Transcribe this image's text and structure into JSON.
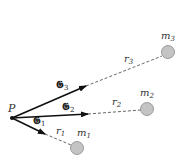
{
  "diagram": {
    "point_label": "P",
    "vectors": [
      {
        "label": "𝕲",
        "subscript": "1"
      },
      {
        "label": "𝕲",
        "subscript": "2"
      },
      {
        "label": "𝕲",
        "subscript": "3"
      }
    ],
    "distances": [
      {
        "label": "r",
        "subscript": "1"
      },
      {
        "label": "r",
        "subscript": "2"
      },
      {
        "label": "r",
        "subscript": "3"
      }
    ],
    "masses": [
      {
        "label": "m",
        "subscript": "1"
      },
      {
        "label": "m",
        "subscript": "2"
      },
      {
        "label": "m",
        "subscript": "3"
      }
    ],
    "colors": {
      "mass_fill": "#c4c4c4",
      "mass_stroke": "#888888",
      "line": "#222222"
    }
  }
}
